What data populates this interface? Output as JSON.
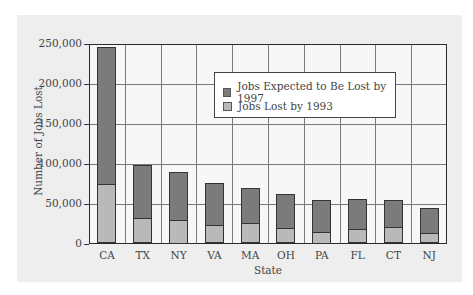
{
  "chart_data": {
    "type": "bar",
    "stacked": true,
    "title": "",
    "xlabel": "State",
    "ylabel": "Number of Jobs Lost",
    "ylim": [
      0,
      250000
    ],
    "yticks": [
      0,
      50000,
      100000,
      150000,
      200000,
      250000
    ],
    "ytick_labels": [
      "0",
      "50,000",
      "100,000",
      "150,000",
      "200,000",
      "250,000"
    ],
    "grid": true,
    "legend_position": "upper center inside plot",
    "categories": [
      "CA",
      "TX",
      "NY",
      "VA",
      "MA",
      "OH",
      "PA",
      "FL",
      "CT",
      "NJ"
    ],
    "series": [
      {
        "name": "Jobs Lost by 1993",
        "color": "#b9b9b9",
        "values": [
          74000,
          32000,
          30000,
          23000,
          26000,
          19000,
          15000,
          17500,
          20000,
          13000
        ]
      },
      {
        "name": "Jobs Expected to Be Lost by 1997",
        "color": "#7b7b7b",
        "values": [
          172000,
          66000,
          60000,
          53000,
          44000,
          43500,
          40000,
          38500,
          34500,
          31500
        ]
      }
    ],
    "totals": [
      246000,
      98000,
      90000,
      76000,
      70000,
      62500,
      55000,
      56000,
      54500,
      44500
    ]
  },
  "legend": {
    "items": [
      {
        "label": "Jobs Expected to Be Lost by 1997",
        "color": "#7b7b7b"
      },
      {
        "label": "Jobs Lost by 1993",
        "color": "#b9b9b9"
      }
    ]
  }
}
